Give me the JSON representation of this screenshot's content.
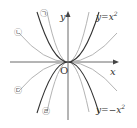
{
  "diagram": {
    "title": "",
    "axes": {
      "x_label": "x",
      "y_label": "y",
      "origin_label": "O"
    },
    "curves": [
      {
        "id": "y_eq_x2",
        "label": "y=x²",
        "label_html": "y=x",
        "exp": "2",
        "color": "#333333",
        "a": 1
      },
      {
        "id": "y_eq_neg_x2",
        "label": "y=−x²",
        "label_html": "y=−x",
        "exp": "2",
        "color": "#333333",
        "a": -1
      },
      {
        "id": "giyeok",
        "label": "㉠",
        "color": "#999999",
        "desc": "steeper upward parabola"
      },
      {
        "id": "nieun",
        "label": "㉡",
        "color": "#999999",
        "desc": "wider upward parabola"
      },
      {
        "id": "digeut",
        "label": "㉢",
        "color": "#999999",
        "desc": "wider downward parabola"
      },
      {
        "id": "rieul",
        "label": "㉣",
        "color": "#999999",
        "desc": "steeper downward parabola"
      }
    ]
  }
}
